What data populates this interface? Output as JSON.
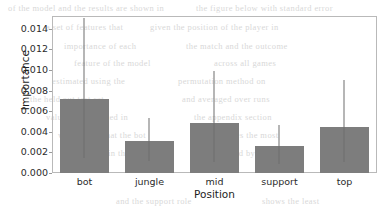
{
  "chart_data": {
    "type": "bar",
    "title": "",
    "xlabel": "Position",
    "ylabel": "Importance",
    "categories": [
      "bot",
      "jungle",
      "mid",
      "support",
      "top"
    ],
    "values": [
      0.0072,
      0.0031,
      0.0049,
      0.0026,
      0.0045
    ],
    "error_low": [
      0.0015,
      0.0012,
      0.0011,
      0.0009,
      0.0011
    ],
    "error_high": [
      0.0151,
      0.0053,
      0.0099,
      0.0047,
      0.009
    ],
    "ylim": [
      0.0,
      0.01525
    ],
    "xlim_categories": 5,
    "yticks": [
      0.0,
      0.002,
      0.004,
      0.006,
      0.008,
      0.01,
      0.012,
      0.014
    ],
    "ytick_labels": [
      "0.000",
      "0.002",
      "0.004",
      "0.006",
      "0.008",
      "0.010",
      "0.012",
      "0.014"
    ],
    "grid": false,
    "legend": null,
    "bar_color": "#7d7d7d",
    "error_color": "#6f6f6f",
    "frame_color": "#b9b9b9",
    "background": "#ffffff"
  },
  "ghost_text": {
    "lines": [
      {
        "text": "of the model and the results are shown in",
        "x": 8,
        "y": 3
      },
      {
        "text": "the figure below with standard error",
        "x": 196,
        "y": 3
      },
      {
        "text": "a set of features that",
        "x": 46,
        "y": 22
      },
      {
        "text": "given the position of the player in",
        "x": 150,
        "y": 22
      },
      {
        "text": "importance of each",
        "x": 64,
        "y": 41
      },
      {
        "text": "the match and the outcome",
        "x": 186,
        "y": 41
      },
      {
        "text": "feature of the model",
        "x": 74,
        "y": 58
      },
      {
        "text": "across all games",
        "x": 214,
        "y": 58
      },
      {
        "text": "estimated using the",
        "x": 52,
        "y": 76
      },
      {
        "text": "permutation method on",
        "x": 178,
        "y": 76
      },
      {
        "text": "the held out test set",
        "x": 30,
        "y": 94
      },
      {
        "text": "and averaged over runs",
        "x": 182,
        "y": 94
      },
      {
        "text": "values are reported in",
        "x": 46,
        "y": 112
      },
      {
        "text": "the appendix section",
        "x": 194,
        "y": 112
      },
      {
        "text": "we observe that the bot",
        "x": 58,
        "y": 130
      },
      {
        "text": "lane carries the most",
        "x": 200,
        "y": 130
      },
      {
        "text": "weight in the model",
        "x": 80,
        "y": 148
      },
      {
        "text": "followed by mid lane",
        "x": 210,
        "y": 148
      },
      {
        "text": "and the support role",
        "x": 116,
        "y": 196
      },
      {
        "text": "shows the least",
        "x": 262,
        "y": 196
      }
    ]
  }
}
